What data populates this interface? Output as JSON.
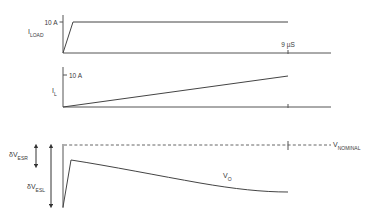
{
  "diagram": {
    "panels": [
      {
        "id": "load-current",
        "signal_label": "I",
        "signal_subscript": "LOAD",
        "level_label": "10 A",
        "time_marker_label": "9 µS",
        "description": "Load current steps quickly from 0 to 10 A and remains flat"
      },
      {
        "id": "inductor-current",
        "signal_label": "I",
        "signal_subscript": "L",
        "level_label": "10 A",
        "description": "Inductor current ramps linearly from 0 toward 10 A, reaching it at 9 µS"
      },
      {
        "id": "output-voltage",
        "signal_label": "V",
        "signal_subscript": "O",
        "reference_label": "V",
        "reference_subscript": "NOMINAL",
        "esr_label": "δV",
        "esr_subscript": "ESR",
        "esl_label": "δV",
        "esl_subscript": "ESL",
        "description": "Output voltage drops sharply (ESL spike), partially recovers (ESR step), then sags further as the capacitor discharges"
      }
    ]
  }
}
